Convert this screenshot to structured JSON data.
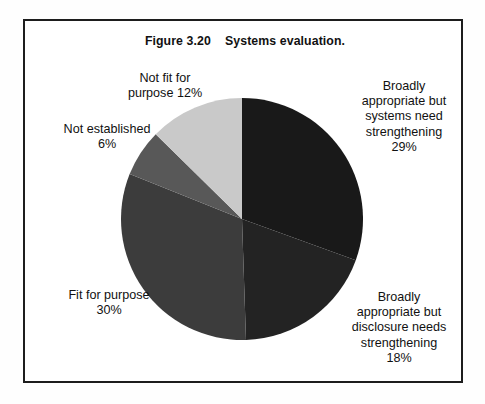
{
  "figure": {
    "title": "Figure 3.20    Systems evaluation.",
    "border_color": "#1d1d1d",
    "background_color": "#ffffff"
  },
  "chart_data": {
    "type": "pie",
    "title": "Figure 3.20    Systems evaluation.",
    "xlabel": "",
    "ylabel": "",
    "unit": "%",
    "start_angle_deg": 0,
    "direction": "clockwise",
    "legend": "none (direct labels)",
    "grid": false,
    "categories": [
      "Broadly appropriate but systems need strengthening",
      "Broadly appropriate but disclosure needs strengthening",
      "Fit for purpose",
      "Not established",
      "Not fit for purpose"
    ],
    "values": [
      29,
      18,
      30,
      6,
      12
    ],
    "colors": [
      "#191919",
      "#232323",
      "#3c3c3c",
      "#585858",
      "#c9c9c9"
    ],
    "slices": [
      {
        "name": "broadly-appropriate-systems",
        "label_lines": [
          "Broadly",
          "appropriate but",
          "systems need",
          "strengthening",
          "29%"
        ],
        "label_text": "Broadly\nappropriate but\nsystems need\nstrengthening\n29%",
        "value": 29,
        "value_text": "29%",
        "color": "#191919",
        "start_deg": 0,
        "end_deg": 104.4
      },
      {
        "name": "broadly-appropriate-disclosure",
        "label_lines": [
          "Broadly",
          "appropriate but",
          "disclosure needs",
          "strengthening",
          "18%"
        ],
        "label_text": "Broadly\nappropriate but\ndisclosure needs\nstrengthening\n18%",
        "value": 18,
        "value_text": "18%",
        "color": "#232323",
        "start_deg": 104.4,
        "end_deg": 169.2
      },
      {
        "name": "fit-for-purpose",
        "label_lines": [
          "Fit for purpose",
          "30%"
        ],
        "label_text": "Fit for purpose\n30%",
        "value": 30,
        "value_text": "30%",
        "color": "#3c3c3c",
        "start_deg": 169.2,
        "end_deg": 277.2
      },
      {
        "name": "not-established",
        "label_lines": [
          "Not established",
          "6%"
        ],
        "label_text": "Not established\n6%",
        "value": 6,
        "value_text": "6%",
        "color": "#585858",
        "start_deg": 277.2,
        "end_deg": 298.8
      },
      {
        "name": "not-fit-for-purpose",
        "label_lines": [
          "Not fit for",
          "purpose 12%"
        ],
        "label_text": "Not fit for\npurpose 12%",
        "value": 12,
        "value_text": "12%",
        "color": "#c9c9c9",
        "start_deg": 298.8,
        "end_deg": 360
      }
    ]
  }
}
